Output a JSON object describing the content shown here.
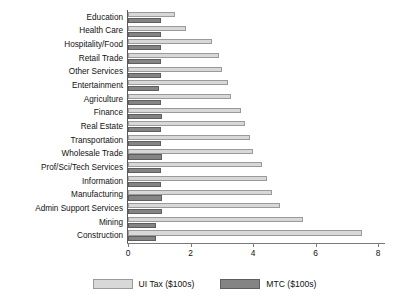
{
  "chart_data": {
    "type": "bar",
    "orientation": "horizontal",
    "title": "",
    "xlabel": "",
    "ylabel": "",
    "xlim": [
      0,
      8
    ],
    "xticks": [
      0,
      2,
      4,
      6,
      8
    ],
    "xtick_labels": [
      "0",
      "2",
      "4",
      "6",
      "8"
    ],
    "grid": false,
    "legend_position": "bottom",
    "categories": [
      "Education",
      "Health Care",
      "Hospitality/Food",
      "Retail Trade",
      "Other Services",
      "Entertainment",
      "Agriculture",
      "Finance",
      "Real Estate",
      "Transportation",
      "Wholesale Trade",
      "Prof/Sci/Tech Services",
      "Information",
      "Manufacturing",
      "Admin Support Services",
      "Mining",
      "Construction"
    ],
    "series": [
      {
        "name": "UI Tax ($100s)",
        "color": "#d8d8d8",
        "values": [
          1.5,
          1.85,
          2.7,
          2.9,
          3.0,
          3.2,
          3.3,
          3.6,
          3.75,
          3.9,
          4.0,
          4.3,
          4.45,
          4.6,
          4.85,
          5.6,
          7.5
        ]
      },
      {
        "name": "MTC ($100s)",
        "color": "#848484",
        "values": [
          1.05,
          1.05,
          1.05,
          1.05,
          1.05,
          1.0,
          1.05,
          1.1,
          1.05,
          1.05,
          1.1,
          1.05,
          1.05,
          1.1,
          1.1,
          0.9,
          0.9
        ]
      }
    ]
  },
  "legend": {
    "items": [
      {
        "label": "UI Tax ($100s)",
        "swatch": "ui-tax-swatch"
      },
      {
        "label": "MTC ($100s)",
        "swatch": "mtc-swatch"
      }
    ]
  }
}
